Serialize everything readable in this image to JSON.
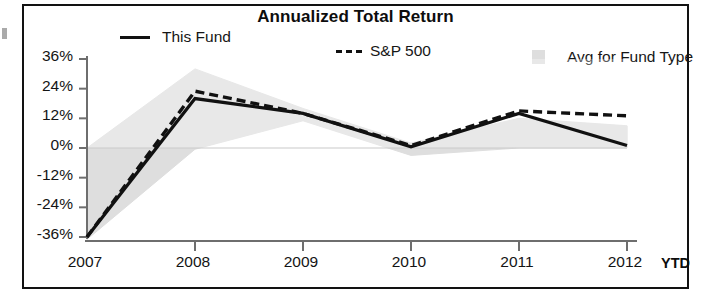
{
  "chart_data": {
    "type": "line",
    "title": "Annualized Total Return",
    "xlabel": "",
    "ylabel": "",
    "x": [
      "2007",
      "2008",
      "2009",
      "2010",
      "2011",
      "2012"
    ],
    "categories": [
      "2007",
      "2008",
      "2009",
      "2010",
      "2011",
      "2012"
    ],
    "x_axis_suffix": "YTD",
    "ytick_labels": [
      "36%",
      "24%",
      "12%",
      "0%",
      "-12%",
      "-24%",
      "-36%"
    ],
    "ytick_values": [
      36,
      24,
      12,
      0,
      -12,
      -24,
      -36
    ],
    "ylim": [
      -38,
      38
    ],
    "grid": false,
    "legend_position": "top",
    "series": [
      {
        "name": "This Fund",
        "style": "solid",
        "color": "#111111",
        "values": [
          -36,
          20,
          14,
          0.5,
          14,
          1
        ]
      },
      {
        "name": "S&P 500",
        "style": "dashed",
        "color": "#111111",
        "values": [
          -36,
          23,
          14,
          1,
          15,
          13
        ]
      },
      {
        "name": "Avg for Fund Type",
        "style": "band",
        "color": "#dedede",
        "band_upper": [
          0,
          32,
          16,
          2,
          12,
          9
        ],
        "band_lower": [
          -37,
          -0.5,
          11,
          -3,
          0,
          0
        ]
      }
    ]
  },
  "chart": {
    "title": "Annualized Total Return",
    "legend": [
      {
        "label": "This Fund",
        "marker": "solid-line-swatch"
      },
      {
        "label": "S&P 500",
        "marker": "dashed-line-swatch"
      },
      {
        "label": "Avg for Fund Type",
        "marker": "gray-box-swatch"
      }
    ],
    "y_axis": {
      "ticks": [
        "36%",
        "24%",
        "12%",
        "0%",
        "-12%",
        "-24%",
        "-36%"
      ]
    },
    "x_axis": {
      "ticks": [
        "2007",
        "2008",
        "2009",
        "2010",
        "2011",
        "2012"
      ],
      "suffix": "YTD"
    }
  }
}
